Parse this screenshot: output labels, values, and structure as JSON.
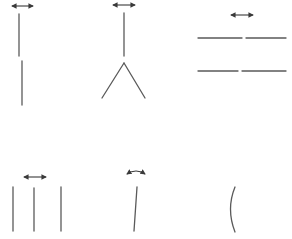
{
  "figure": {
    "line_color": "#5a5a5a",
    "arrow_color": "#3a3a3a",
    "background": "#ffffff",
    "panels": [
      {
        "id": "panel-1",
        "label": "offset vertical segments",
        "arrow": {
          "type": "double-horizontal",
          "x1": 12,
          "x2": 33,
          "y": 6
        },
        "segments": [
          {
            "x1": 19,
            "y1": 14,
            "x2": 19,
            "y2": 56
          },
          {
            "x1": 22,
            "y1": 61,
            "x2": 22,
            "y2": 105
          }
        ]
      },
      {
        "id": "panel-2",
        "label": "vertical segment above inverted V",
        "arrow": {
          "type": "double-horizontal",
          "x1": 113,
          "x2": 135,
          "y": 5
        },
        "segments": [
          {
            "x1": 124,
            "y1": 13,
            "x2": 124,
            "y2": 56
          },
          {
            "x1": 124,
            "y1": 63,
            "x2": 102,
            "y2": 98
          },
          {
            "x1": 124,
            "y1": 63,
            "x2": 145,
            "y2": 98
          }
        ]
      },
      {
        "id": "panel-3",
        "label": "two pairs of collinear horizontal segments",
        "arrow": {
          "type": "double-horizontal",
          "x1": 231,
          "x2": 253,
          "y": 15
        },
        "segments": [
          {
            "x1": 198,
            "y1": 38,
            "x2": 242,
            "y2": 38
          },
          {
            "x1": 246,
            "y1": 38,
            "x2": 286,
            "y2": 38
          },
          {
            "x1": 198,
            "y1": 71,
            "x2": 238,
            "y2": 71
          },
          {
            "x1": 242,
            "y1": 71,
            "x2": 286,
            "y2": 71
          }
        ]
      },
      {
        "id": "panel-4",
        "label": "three parallel vertical lines",
        "arrow": {
          "type": "double-horizontal",
          "x1": 24,
          "x2": 46,
          "y": 177
        },
        "segments": [
          {
            "x1": 13,
            "y1": 187,
            "x2": 13,
            "y2": 231
          },
          {
            "x1": 34,
            "y1": 188,
            "x2": 34,
            "y2": 231
          },
          {
            "x1": 61,
            "y1": 187,
            "x2": 61,
            "y2": 231
          }
        ]
      },
      {
        "id": "panel-5",
        "label": "slightly tilted line with rotation arrow",
        "arrow": {
          "type": "double-curved",
          "x1": 127,
          "x2": 145,
          "y": 174,
          "peak_y": 171
        },
        "segments": [
          {
            "x1": 137,
            "y1": 187,
            "x2": 134,
            "y2": 231
          }
        ]
      },
      {
        "id": "panel-6",
        "label": "curved line (parenthesis shape)",
        "arrow": null,
        "curve": {
          "x_start": 235,
          "y_start": 187,
          "ctrl_x": 226,
          "ctrl_y": 209,
          "x_end": 235,
          "y_end": 232
        }
      }
    ]
  }
}
